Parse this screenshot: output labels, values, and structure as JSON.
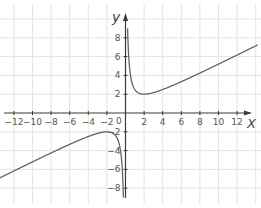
{
  "chart_data": {
    "type": "line",
    "title": "",
    "function": "y = x/2 + 2/x",
    "xlabel": "X",
    "ylabel": "y",
    "xlim": [
      -13.4,
      14
    ],
    "ylim": [
      -9,
      10
    ],
    "grid": true,
    "grid_step": 2,
    "x_ticks": [
      "-12",
      "-10",
      "-8",
      "-6",
      "-4",
      "-2",
      "2",
      "4",
      "6",
      "8",
      "10",
      "12"
    ],
    "y_ticks": [
      "8",
      "6",
      "4",
      "2",
      "-2",
      "-4",
      "-6",
      "-8"
    ],
    "origin_label": "0",
    "series": [
      {
        "name": "right branch",
        "x": [
          0.22,
          0.5,
          1,
          1.5,
          2,
          3,
          4,
          6,
          8,
          10,
          12,
          14
        ],
        "y": [
          9.2,
          4.25,
          2.5,
          2.08,
          2.0,
          2.17,
          2.5,
          3.33,
          4.25,
          5.2,
          6.17,
          7.14
        ]
      },
      {
        "name": "left branch",
        "x": [
          -13.4,
          -12,
          -10,
          -8,
          -6,
          -4,
          -3,
          -2,
          -1.5,
          -1,
          -0.5,
          -0.22
        ],
        "y": [
          -6.85,
          -6.17,
          -5.2,
          -4.25,
          -3.33,
          -2.5,
          -2.17,
          -2.0,
          -2.08,
          -2.5,
          -4.25,
          -9.2
        ]
      }
    ],
    "colors": {
      "curve": "#6b5f5a",
      "axes": "#3a3a3a",
      "grid": "#e4e4e4",
      "text": "#555555"
    }
  }
}
